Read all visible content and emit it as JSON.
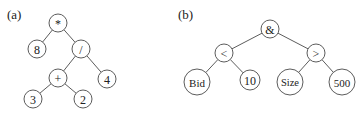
{
  "panels": [
    {
      "id": "a",
      "label": "(a)",
      "label_pos": [
        7,
        19
      ],
      "nodes": [
        {
          "id": "mul",
          "text": "*",
          "x": 58,
          "y": 23,
          "r": 9
        },
        {
          "id": "n8",
          "text": "8",
          "x": 37,
          "y": 49,
          "r": 9
        },
        {
          "id": "div",
          "text": "/",
          "x": 81,
          "y": 49,
          "r": 9
        },
        {
          "id": "add",
          "text": "+",
          "x": 58,
          "y": 78,
          "r": 9
        },
        {
          "id": "n4",
          "text": "4",
          "x": 107,
          "y": 79,
          "r": 9
        },
        {
          "id": "n3",
          "text": "3",
          "x": 33,
          "y": 99,
          "r": 9
        },
        {
          "id": "n2",
          "text": "2",
          "x": 83,
          "y": 99,
          "r": 9
        }
      ],
      "edges": [
        [
          "mul",
          "n8"
        ],
        [
          "mul",
          "div"
        ],
        [
          "div",
          "add"
        ],
        [
          "div",
          "n4"
        ],
        [
          "add",
          "n3"
        ],
        [
          "add",
          "n2"
        ]
      ]
    },
    {
      "id": "b",
      "label": "(b)",
      "label_pos": [
        178,
        19
      ],
      "nodes": [
        {
          "id": "and",
          "text": "&",
          "x": 270,
          "y": 29,
          "r": 9
        },
        {
          "id": "lt",
          "text": "<",
          "x": 224,
          "y": 53,
          "r": 9
        },
        {
          "id": "gt",
          "text": ">",
          "x": 316,
          "y": 53,
          "r": 9
        },
        {
          "id": "bid",
          "text": "Bid",
          "x": 197,
          "y": 82,
          "r": 13
        },
        {
          "id": "n10",
          "text": "10",
          "x": 250,
          "y": 80,
          "r": 10
        },
        {
          "id": "size",
          "text": "Size",
          "x": 290,
          "y": 82,
          "r": 13
        },
        {
          "id": "n500",
          "text": "500",
          "x": 342,
          "y": 82,
          "r": 13
        }
      ],
      "edges": [
        [
          "and",
          "lt"
        ],
        [
          "and",
          "gt"
        ],
        [
          "lt",
          "bid"
        ],
        [
          "lt",
          "n10"
        ],
        [
          "gt",
          "size"
        ],
        [
          "gt",
          "n500"
        ]
      ]
    }
  ],
  "colors": {
    "stroke": "#4a4a4a",
    "text": "#222222",
    "background": "#ffffff"
  }
}
